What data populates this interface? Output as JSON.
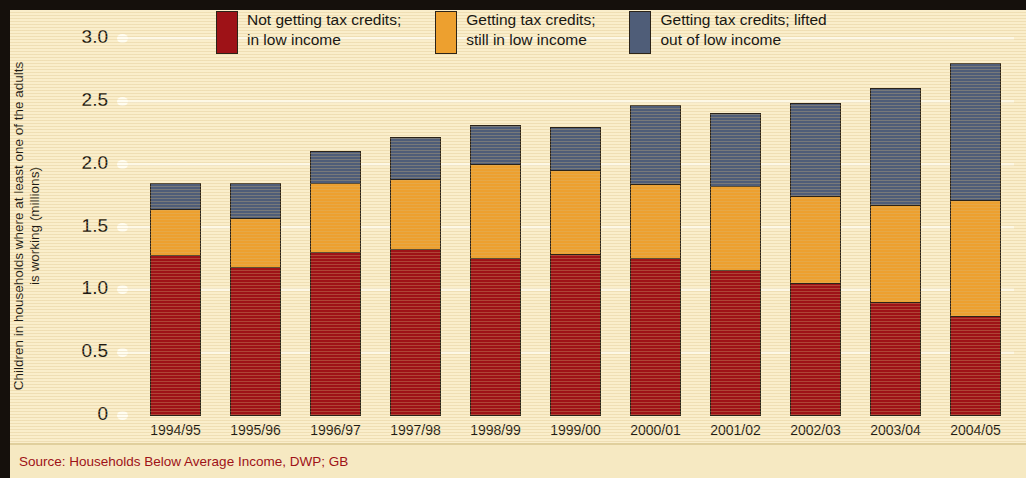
{
  "chart_data": {
    "type": "bar",
    "stacked": true,
    "title": "",
    "xlabel": "",
    "ylabel": "Children in households where at least one\nof the adults is working (millions)",
    "ylim": [
      0,
      3.0
    ],
    "yticks": [
      "0",
      "0.5",
      "1.0",
      "1.5",
      "2.0",
      "2.5",
      "3.0"
    ],
    "ytick_values": [
      0,
      0.5,
      1.0,
      1.5,
      2.0,
      2.5,
      3.0
    ],
    "grid": true,
    "legend_position": "top",
    "categories": [
      "1994/95",
      "1995/96",
      "1996/97",
      "1997/98",
      "1998/99",
      "1999/00",
      "2000/01",
      "2001/02",
      "2002/03",
      "2003/04",
      "2004/05"
    ],
    "series": [
      {
        "name": "Not getting tax credits;\nin low income",
        "color": "#9e1217",
        "values": [
          1.27,
          1.18,
          1.3,
          1.32,
          1.25,
          1.28,
          1.25,
          1.15,
          1.05,
          0.9,
          0.79
        ]
      },
      {
        "name": "Getting tax credits;\nstill in low income",
        "color": "#eda02f",
        "values": [
          0.37,
          0.39,
          0.55,
          0.56,
          0.75,
          0.67,
          0.59,
          0.67,
          0.69,
          0.77,
          0.92
        ]
      },
      {
        "name": "Getting tax credits; lifted\nout of low income",
        "color": "#4f5d78",
        "values": [
          0.21,
          0.28,
          0.25,
          0.33,
          0.31,
          0.34,
          0.63,
          0.58,
          0.74,
          0.93,
          1.09
        ]
      }
    ],
    "totals": [
      1.85,
      1.85,
      2.1,
      2.21,
      2.31,
      2.29,
      2.47,
      2.4,
      2.48,
      2.6,
      2.8
    ]
  },
  "legend": {
    "items": [
      {
        "label": "Not getting tax credits;\nin low income",
        "color": "#9e1217"
      },
      {
        "label": "Getting tax credits;\nstill in low income",
        "color": "#eda02f"
      },
      {
        "label": "Getting tax credits; lifted\nout of low income",
        "color": "#4f5d78"
      }
    ]
  },
  "footer": {
    "source": "Source: Households Below Average Income, DWP; GB"
  },
  "colors": {
    "background": "#faeecb",
    "footer_background": "#f6e9c2",
    "border": "#15100c",
    "gridline": "#fdf8e6",
    "text": "#1d1a14",
    "source_text": "#9e1217"
  }
}
